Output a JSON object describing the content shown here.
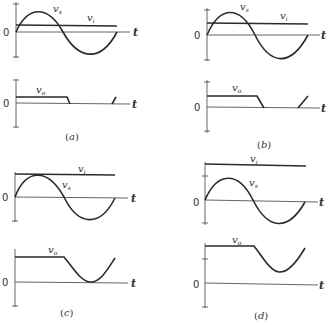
{
  "figure": {
    "panels": [
      {
        "id": "a",
        "caption": "(a)",
        "caption_letter": "a",
        "top_plot": {
          "labels": {
            "vs": "v",
            "vs_sub": "s",
            "vi": "v",
            "vi_sub": "i",
            "zero": "0",
            "t": "t"
          },
          "vi_level": "small positive (below vs peak)"
        },
        "bottom_plot": {
          "labels": {
            "vo": "v",
            "vo_sub": "o",
            "zero": "0",
            "t": "t"
          }
        }
      },
      {
        "id": "b",
        "caption": "(b)",
        "caption_letter": "b",
        "top_plot": {
          "labels": {
            "vs": "v",
            "vs_sub": "s",
            "vi": "v",
            "vi_sub": "i",
            "zero": "0",
            "t": "t"
          },
          "vi_level": "about half of vs peak"
        },
        "bottom_plot": {
          "labels": {
            "vo": "v",
            "vo_sub": "o",
            "zero": "0",
            "t": "t"
          }
        }
      },
      {
        "id": "c",
        "caption": "(c)",
        "caption_letter": "c",
        "top_plot": {
          "labels": {
            "vs": "v",
            "vs_sub": "s",
            "vi": "v",
            "vi_sub": "i",
            "zero": "0",
            "t": "t"
          },
          "vi_level": "equal to vs peak"
        },
        "bottom_plot": {
          "labels": {
            "vo": "v",
            "vo_sub": "o",
            "zero": "0",
            "t": "t"
          }
        }
      },
      {
        "id": "d",
        "caption": "(d)",
        "caption_letter": "d",
        "top_plot": {
          "labels": {
            "vs": "v",
            "vs_sub": "s",
            "vi": "v",
            "vi_sub": "i",
            "zero": "0",
            "t": "t"
          },
          "vi_level": "above vs peak"
        },
        "bottom_plot": {
          "labels": {
            "vo": "v",
            "vo_sub": "o",
            "zero": "0",
            "t": "t"
          }
        }
      }
    ]
  }
}
